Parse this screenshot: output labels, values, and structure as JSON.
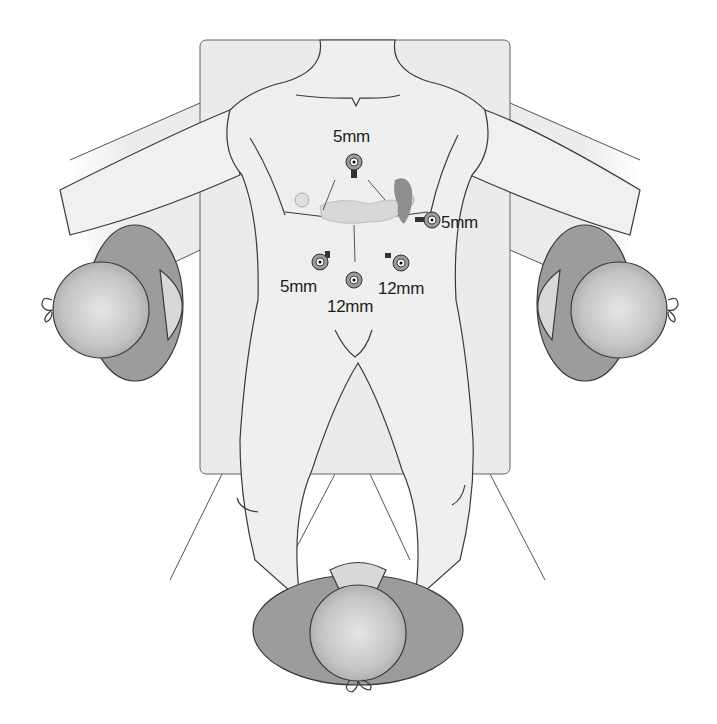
{
  "figure": {
    "colors": {
      "background": "#ffffff",
      "table": "#ebebeb",
      "skin": "#efefef",
      "outline": "#3a3a3a",
      "surgeon_gown": "#9a9a9a",
      "surgeon_cap": "#c8c8c8",
      "organ_spleen": "#8a8a8a",
      "organ_pancreas": "#d4d4d4"
    }
  },
  "ports": [
    {
      "id": "epigastric",
      "label": "5mm",
      "x": 354,
      "y": 160
    },
    {
      "id": "left-subcostal",
      "label": "5mm",
      "x": 430,
      "y": 220
    },
    {
      "id": "right-lateral",
      "label": "5mm",
      "x": 320,
      "y": 261
    },
    {
      "id": "umbilical",
      "label": "12mm",
      "x": 354,
      "y": 282
    },
    {
      "id": "left-lateral",
      "label": "12mm",
      "x": 402,
      "y": 262
    }
  ],
  "labels": {
    "epigastric": "5mm",
    "left_subcostal": "5mm",
    "right_lateral": "5mm",
    "umbilical": "12mm",
    "left_lateral": "12mm"
  },
  "people": [
    {
      "id": "surgeon-left",
      "position": "patient right side"
    },
    {
      "id": "surgeon-right",
      "position": "patient left side"
    },
    {
      "id": "surgeon-bottom",
      "position": "between legs"
    }
  ]
}
